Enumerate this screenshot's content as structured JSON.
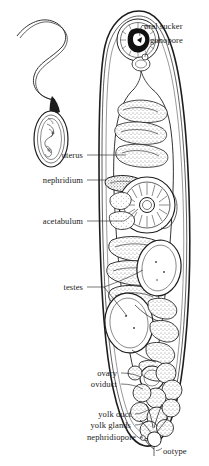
{
  "figure": {
    "background_color": "#ffffff",
    "ink_color": "#1d1d1d",
    "inset": {
      "name": "cercaria-inset",
      "description": "small oval-bodied organism with long curving tail"
    },
    "labels": [
      {
        "id": "oral-sucker",
        "text": "oral sucker",
        "align": "left",
        "x": 144,
        "y": 27
      },
      {
        "id": "gonopore",
        "text": "gonopore",
        "align": "left",
        "x": 150,
        "y": 41
      },
      {
        "id": "uterus",
        "text": "uterus",
        "align": "right",
        "x": 83,
        "y": 156
      },
      {
        "id": "nephridium",
        "text": "nephridium",
        "align": "right",
        "x": 83,
        "y": 181
      },
      {
        "id": "acetabulum",
        "text": "acetabulum",
        "align": "right",
        "x": 83,
        "y": 222
      },
      {
        "id": "testes",
        "text": "testes",
        "align": "right",
        "x": 83,
        "y": 288
      },
      {
        "id": "ovary",
        "text": "ovary",
        "align": "right",
        "x": 117,
        "y": 374
      },
      {
        "id": "oviduct",
        "text": "oviduct",
        "align": "right",
        "x": 117,
        "y": 385
      },
      {
        "id": "yolk-duct",
        "text": "yolk duct",
        "align": "right",
        "x": 131,
        "y": 415
      },
      {
        "id": "yolk-glands",
        "text": "yolk glands",
        "align": "right",
        "x": 131,
        "y": 426
      },
      {
        "id": "nephridiopore",
        "text": "nephridiopore",
        "align": "right",
        "x": 136,
        "y": 438
      },
      {
        "id": "ootype",
        "text": "ootype",
        "align": "left",
        "x": 163,
        "y": 452
      }
    ]
  }
}
